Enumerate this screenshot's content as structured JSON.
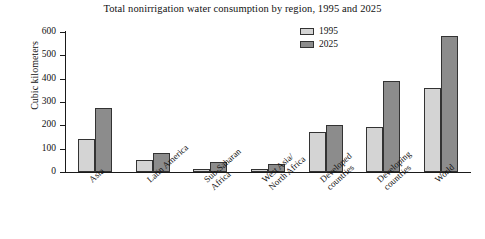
{
  "chart_data": {
    "type": "bar",
    "title": "Total nonirrigation water consumption by region, 1995 and 2025",
    "xlabel": "",
    "ylabel": "Cubic kilometers",
    "ylim": [
      0,
      600
    ],
    "yticks": [
      0,
      100,
      200,
      300,
      400,
      500,
      600
    ],
    "ytick_labels": [
      "0",
      "100",
      "200",
      "300",
      "400",
      "500",
      "600"
    ],
    "grid": false,
    "legend_position": "top-right",
    "categories": [
      "Asia",
      "Latin America",
      "Sub-Saharan\nAfrica",
      "West Asia/\nNorth Africa",
      "Developed\ncountries",
      "Developing\ncountries",
      "World"
    ],
    "series": [
      {
        "name": "1995",
        "color": "#d4d4d4",
        "values": [
          140,
          50,
          15,
          15,
          170,
          195,
          360
        ]
      },
      {
        "name": "2025",
        "color": "#8c8c8c",
        "values": [
          275,
          80,
          45,
          35,
          200,
          390,
          585
        ]
      }
    ]
  },
  "legend": {
    "items": [
      {
        "label": "1995"
      },
      {
        "label": "2025"
      }
    ]
  },
  "colors": {
    "series_1995": "#d4d4d4",
    "series_2025": "#8c8c8c",
    "axis": "#1a1a1a",
    "background": "#ffffff"
  }
}
